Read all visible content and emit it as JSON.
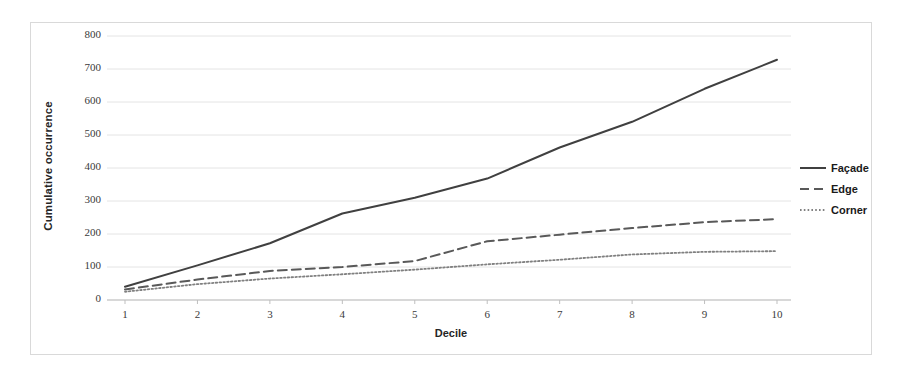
{
  "chart_data": {
    "type": "line",
    "title": "",
    "subtitle": "",
    "xlabel": "Decile",
    "ylabel": "Cumulative occurrence",
    "categories": [
      1,
      2,
      3,
      4,
      5,
      6,
      7,
      8,
      9,
      10
    ],
    "x": [
      1,
      2,
      3,
      4,
      5,
      6,
      7,
      8,
      9,
      10
    ],
    "xlim": [
      1,
      10
    ],
    "ylim": [
      0,
      800
    ],
    "y_ticks": [
      0,
      100,
      200,
      300,
      400,
      500,
      600,
      700,
      800
    ],
    "x_ticks": [
      1,
      2,
      3,
      4,
      5,
      6,
      7,
      8,
      9,
      10
    ],
    "grid": "horizontal",
    "legend_position": "right",
    "series": [
      {
        "name": "Façade",
        "style": "solid",
        "color": "#404040",
        "values": [
          40,
          105,
          172,
          262,
          310,
          368,
          462,
          540,
          640,
          728
        ]
      },
      {
        "name": "Edge",
        "style": "dashed",
        "color": "#595959",
        "values": [
          32,
          62,
          88,
          100,
          118,
          178,
          198,
          218,
          236,
          245
        ]
      },
      {
        "name": "Corner",
        "style": "dotted",
        "color": "#808080",
        "values": [
          25,
          48,
          65,
          78,
          92,
          108,
          122,
          138,
          146,
          148
        ]
      }
    ]
  },
  "axes": {
    "y_title": "Cumulative occurrence",
    "x_title": "Decile",
    "y_tick_labels": [
      "800",
      "700",
      "600",
      "500",
      "400",
      "300",
      "200",
      "100",
      "0"
    ],
    "x_tick_labels": [
      "1",
      "2",
      "3",
      "4",
      "5",
      "6",
      "7",
      "8",
      "9",
      "10"
    ]
  },
  "legend": {
    "items": [
      {
        "label": "Façade",
        "style": "solid"
      },
      {
        "label": "Edge",
        "style": "dashed"
      },
      {
        "label": "Corner",
        "style": "dotted"
      }
    ]
  },
  "colors": {
    "facade": "#404040",
    "edge": "#595959",
    "corner": "#808080",
    "gridline": "#e4e4e4",
    "axis": "#bfbfbf",
    "frame": "#d9d9d9"
  }
}
